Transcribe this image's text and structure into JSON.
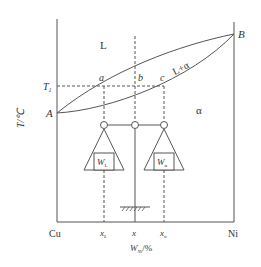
{
  "diagram": {
    "type": "binary isomorphous phase diagram with lever rule",
    "y_axis_label": "T/℃",
    "x_axis_label": "W_Ni/%",
    "x_axis_label_main": "W",
    "x_axis_label_sub": "Ni",
    "x_axis_label_suffix": "/%",
    "left_end": "Cu",
    "right_end": "Ni",
    "regions": {
      "liquid": "L",
      "two_phase": "L+α",
      "solid": "α"
    },
    "points": {
      "A": "A",
      "B": "B",
      "a": "a",
      "b": "b",
      "c": "c"
    },
    "temperature_label": "T",
    "temperature_sub": "1",
    "x_ticks": [
      {
        "main": "x",
        "sub": "L"
      },
      {
        "main": "x",
        "sub": ""
      },
      {
        "main": "x",
        "sub": "α"
      }
    ],
    "weights": {
      "left": {
        "main": "W",
        "sub": "L"
      },
      "right": {
        "main": "W",
        "sub": "α"
      }
    },
    "colors": {
      "line": "#555555",
      "text": "#333333"
    }
  }
}
